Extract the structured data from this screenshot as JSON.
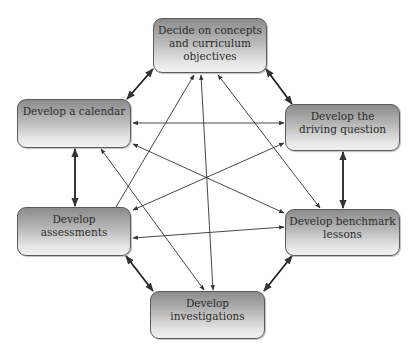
{
  "diagram": {
    "nodes": [
      {
        "id": "objectives",
        "label": "Decide on concepts\nand curriculum\nobjectives"
      },
      {
        "id": "calendar",
        "label": "Develop a calendar"
      },
      {
        "id": "driving_question",
        "label": "Develop the\ndriving question"
      },
      {
        "id": "assessments",
        "label": "Develop\nassessments"
      },
      {
        "id": "benchmark",
        "label": "Develop benchmark\nlessons"
      },
      {
        "id": "investigations",
        "label": "Develop\ninvestigations"
      }
    ],
    "edges": [
      {
        "from": "objectives",
        "to": "calendar",
        "direction": "both",
        "weight": "thick"
      },
      {
        "from": "objectives",
        "to": "driving_question",
        "direction": "both",
        "weight": "thick"
      },
      {
        "from": "calendar",
        "to": "driving_question",
        "direction": "both",
        "weight": "thin"
      },
      {
        "from": "calendar",
        "to": "assessments",
        "direction": "both",
        "weight": "thick"
      },
      {
        "from": "driving_question",
        "to": "benchmark",
        "direction": "both",
        "weight": "thick"
      },
      {
        "from": "assessments",
        "to": "benchmark",
        "direction": "both",
        "weight": "thin"
      },
      {
        "from": "assessments",
        "to": "investigations",
        "direction": "both",
        "weight": "thick"
      },
      {
        "from": "benchmark",
        "to": "investigations",
        "direction": "both",
        "weight": "thick"
      },
      {
        "from": "assessments",
        "to": "objectives",
        "direction": "forward",
        "weight": "thin"
      },
      {
        "from": "investigations",
        "to": "objectives",
        "direction": "forward",
        "weight": "thin"
      },
      {
        "from": "benchmark",
        "to": "objectives",
        "direction": "forward",
        "weight": "thin"
      },
      {
        "from": "driving_question",
        "to": "assessments",
        "direction": "both",
        "weight": "thin"
      },
      {
        "from": "calendar",
        "to": "benchmark",
        "direction": "both",
        "weight": "thin"
      },
      {
        "from": "calendar",
        "to": "investigations",
        "direction": "both",
        "weight": "thin"
      }
    ]
  },
  "colors": {
    "node_border": "#5a5a5a",
    "node_gradient_top": "#8c8c8c",
    "node_gradient_bottom": "#f2f2f2",
    "text": "#2b2b2b",
    "arrow": "#333333"
  }
}
